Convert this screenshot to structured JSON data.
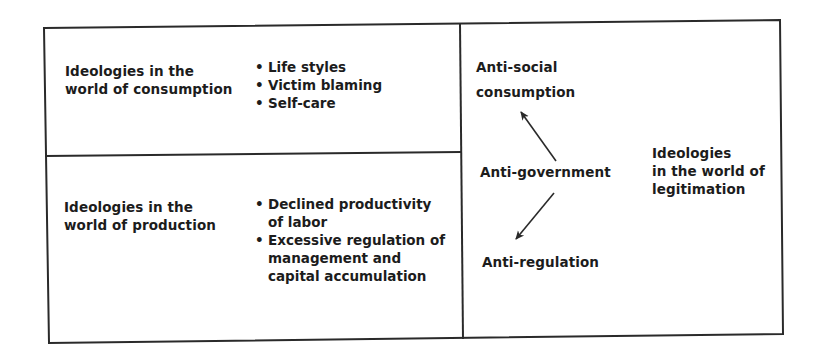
{
  "diagram": {
    "colors": {
      "line": "#2a2a2a",
      "text": "#1c1c1c",
      "background": "#ffffff"
    },
    "consumption_panel": {
      "title_lines": [
        "Ideologies in the",
        "world of consumption"
      ],
      "items": [
        "Life styles",
        "Victim blaming",
        "Self-care"
      ]
    },
    "production_panel": {
      "title_lines": [
        "Ideologies in the",
        "world of production"
      ],
      "items": [
        {
          "lines": [
            "Declined productivity",
            "of labor"
          ]
        },
        {
          "lines": [
            "Excessive regulation of",
            "management and",
            "capital accumulation"
          ]
        }
      ]
    },
    "legitimation_panel": {
      "title_lines": [
        "Ideologies",
        "in the world of",
        "legitimation"
      ],
      "nodes": {
        "top": [
          "Anti-social",
          "consumption"
        ],
        "center": "Anti-government",
        "bottom": "Anti-regulation"
      },
      "arrows": [
        {
          "from": "center",
          "to": "top"
        },
        {
          "from": "center",
          "to": "bottom"
        }
      ]
    }
  }
}
